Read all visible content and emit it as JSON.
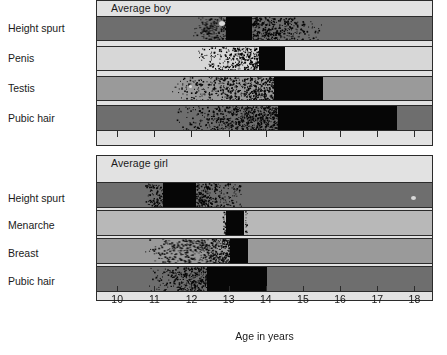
{
  "chart_data": {
    "type": "bar",
    "title": "",
    "xlabel": "Age in years",
    "ylabel": "",
    "xlim": [
      9.43,
      18.5
    ],
    "grid": false,
    "legend": "none",
    "tick_labels": [
      "10",
      "11",
      "12",
      "13",
      "14",
      "15",
      "16",
      "17",
      "18"
    ],
    "ticks": [
      10,
      11,
      12,
      13,
      14,
      15,
      16,
      17,
      18
    ],
    "panels": [
      {
        "name": "Average boy",
        "categories": [
          "Height spurt",
          "Penis",
          "Testis",
          "Pubic hair"
        ],
        "series": [
          {
            "name": "Height spurt",
            "start": 12.0,
            "peak_start": 12.9,
            "peak_end": 13.6,
            "end": 15.5,
            "track_color": "#6e6e6e"
          },
          {
            "name": "Penis",
            "start": 12.1,
            "peak_start": 13.8,
            "peak_end": 14.5,
            "end": 14.5,
            "track_color": "#d7d7d7"
          },
          {
            "name": "Testis",
            "start": 11.4,
            "peak_start": 14.2,
            "peak_end": 15.5,
            "end": 15.5,
            "track_color": "#9a9a9a"
          },
          {
            "name": "Pubic hair",
            "start": 11.5,
            "peak_start": 14.3,
            "peak_end": 17.5,
            "end": 17.5,
            "track_color": "#6e6e6e"
          }
        ]
      },
      {
        "name": "Average girl",
        "categories": [
          "Height spurt",
          "Menarche",
          "Breast",
          "Pubic hair"
        ],
        "series": [
          {
            "name": "Height spurt",
            "start": 10.7,
            "peak_start": 11.2,
            "peak_end": 12.1,
            "end": 13.5,
            "track_color": "#6e6e6e"
          },
          {
            "name": "Menarche",
            "start": 12.8,
            "peak_start": 12.9,
            "peak_end": 13.4,
            "end": 13.5,
            "track_color": "#b8b8b8"
          },
          {
            "name": "Breast",
            "start": 10.7,
            "peak_start": 13.0,
            "peak_end": 13.5,
            "end": 13.5,
            "track_color": "#9a9a9a"
          },
          {
            "name": "Pubic hair",
            "start": 10.8,
            "peak_start": 12.4,
            "peak_end": 14.0,
            "end": 14.0,
            "track_color": "#6e6e6e"
          }
        ]
      }
    ]
  },
  "panels": {
    "boy": {
      "title": "Average boy",
      "rows": [
        {
          "label": "Height spurt"
        },
        {
          "label": "Penis"
        },
        {
          "label": "Testis"
        },
        {
          "label": "Pubic hair"
        }
      ]
    },
    "girl": {
      "title": "Average girl",
      "rows": [
        {
          "label": "Height spurt"
        },
        {
          "label": "Menarche"
        },
        {
          "label": "Breast"
        },
        {
          "label": "Pubic hair"
        }
      ]
    }
  },
  "axis": {
    "title": "Age in years",
    "labels": [
      "10",
      "11",
      "12",
      "13",
      "14",
      "15",
      "16",
      "17",
      "18"
    ]
  },
  "colors": {
    "background": "#ffffff",
    "panel_fill": "#e2e2e2",
    "border": "#2b2b2b",
    "track_dark": "#6e6e6e",
    "track_mid": "#9a9a9a",
    "track_light": "#d7d7d7",
    "track_menarche": "#b8b8b8",
    "solid": "#060606",
    "text": "#1a1a1a"
  }
}
